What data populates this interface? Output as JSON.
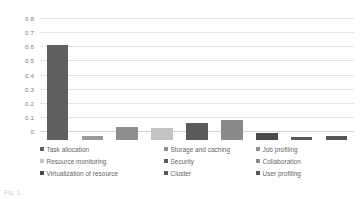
{
  "chart_data": {
    "type": "bar",
    "title": "",
    "xlabel": "",
    "ylabel": "",
    "ylim": [
      0,
      0.8
    ],
    "ytick_labels": [
      "0.8",
      "0.7",
      "0.6",
      "0.5",
      "0.4",
      "0.3",
      "0.2",
      "0.1",
      "0"
    ],
    "ytick_values": [
      0.8,
      0.7,
      0.6,
      0.5,
      0.4,
      0.3,
      0.2,
      0.1,
      0
    ],
    "grid": true,
    "legend_position": "bottom",
    "categories": [
      "Task allocation",
      "Storage and caching",
      "Job profiling",
      "Resource monitoring",
      "Security",
      "Collaboration",
      "Virtualization of resource",
      "Cluster",
      "User profiling"
    ],
    "values": [
      0.675,
      0.03,
      0.095,
      0.085,
      0.12,
      0.14,
      0.05,
      0.02,
      0.025
    ],
    "colors": [
      "#5f5f5f",
      "#9a9a9a",
      "#8e8e8e",
      "#c3c3c3",
      "#5a5a5a",
      "#8a8a8a",
      "#4a4a4a",
      "#595959",
      "#555555"
    ]
  },
  "legend": {
    "rows": [
      [
        {
          "label": "Task allocation",
          "color": "#5f5f5f"
        },
        {
          "label": "Storage and caching",
          "color": "#8e8e8e"
        },
        {
          "label": "Job profiling",
          "color": "#8e8e8e"
        }
      ],
      [
        {
          "label": "Resource monitoring",
          "color": "#c3c3c3"
        },
        {
          "label": "Security",
          "color": "#5a5a5a"
        },
        {
          "label": "Collaboration",
          "color": "#8a8a8a"
        }
      ],
      [
        {
          "label": "Virtualization of resource",
          "color": "#4a4a4a"
        },
        {
          "label": "Cluster",
          "color": "#595959"
        },
        {
          "label": "User profiling",
          "color": "#555555"
        }
      ]
    ]
  },
  "caption": {
    "text": "Fig. 1."
  }
}
